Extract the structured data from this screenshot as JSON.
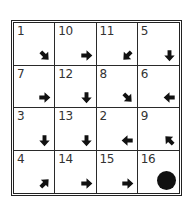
{
  "puzzle": {
    "cells": [
      {
        "number": "1",
        "arrow": "se"
      },
      {
        "number": "10",
        "arrow": "e"
      },
      {
        "number": "11",
        "arrow": "sw"
      },
      {
        "number": "5",
        "arrow": "s"
      },
      {
        "number": "7",
        "arrow": "e"
      },
      {
        "number": "12",
        "arrow": "s"
      },
      {
        "number": "8",
        "arrow": "se"
      },
      {
        "number": "6",
        "arrow": "w"
      },
      {
        "number": "3",
        "arrow": "s"
      },
      {
        "number": "13",
        "arrow": "s"
      },
      {
        "number": "2",
        "arrow": "w"
      },
      {
        "number": "9",
        "arrow": "nw"
      },
      {
        "number": "4",
        "arrow": "ne"
      },
      {
        "number": "14",
        "arrow": "e"
      },
      {
        "number": "15",
        "arrow": "e"
      },
      {
        "number": "16",
        "arrow": "goal-dot"
      }
    ],
    "colors": {
      "ink": "#111111",
      "grid": "#2a2a2a",
      "background": "#ffffff"
    }
  }
}
